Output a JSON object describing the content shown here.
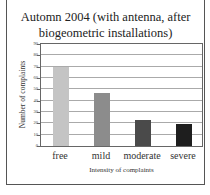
{
  "chart_data": {
    "type": "bar",
    "title": "Automn 2004 (with antenna, after biogeometric installations)",
    "title_lines": [
      "Automn 2004 (with antenna, after",
      "biogeometric installations)"
    ],
    "xlabel": "Intensity of complaints",
    "ylabel": "Number of complaints",
    "categories": [
      "free",
      "mild",
      "moderate",
      "severe"
    ],
    "values": [
      70,
      47,
      23,
      19
    ],
    "colors": [
      "#c4c4c4",
      "#8c8c8c",
      "#4a4a4a",
      "#1e1e1e"
    ],
    "ylim": [
      0,
      90
    ],
    "yticks": [
      0,
      10,
      20,
      30,
      40,
      50,
      60,
      70,
      80,
      90
    ],
    "grid": true,
    "legend": "none"
  }
}
